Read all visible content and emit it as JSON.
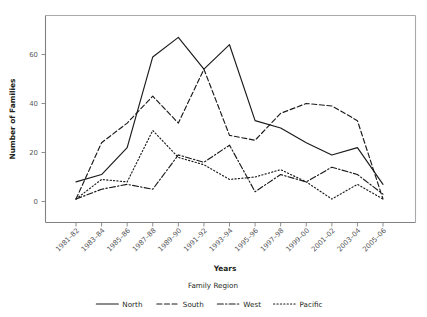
{
  "chart_data": {
    "type": "line",
    "title": "",
    "xlabel": "Years",
    "ylabel": "Number of Families",
    "legend_title": "Family Region",
    "legend_position": "bottom",
    "grid": false,
    "xlim": [
      0,
      12
    ],
    "ylim": [
      0,
      72
    ],
    "yticks": [
      0,
      20,
      40,
      60
    ],
    "ytick_labels": [
      "0",
      "20",
      "40",
      "60"
    ],
    "categories": [
      "1981–82",
      "1983–84",
      "1985–86",
      "1987–88",
      "1989–90",
      "1991–92",
      "1993–94",
      "1995–96",
      "1997–98",
      "1999–00",
      "2001–02",
      "2003–04",
      "2005–06"
    ],
    "series": [
      {
        "name": "North",
        "style": "solid",
        "values": [
          8,
          11,
          22,
          59,
          67,
          54,
          64,
          33,
          30,
          24,
          19,
          22,
          7
        ]
      },
      {
        "name": "South",
        "style": "dashed",
        "values": [
          1,
          24,
          32,
          43,
          32,
          54,
          27,
          25,
          36,
          40,
          39,
          33,
          1
        ]
      },
      {
        "name": "West",
        "style": "dashdot",
        "values": [
          1,
          5,
          7,
          5,
          19,
          16,
          23,
          4,
          11,
          8,
          14,
          11,
          3
        ]
      },
      {
        "name": "Pacific",
        "style": "dotted",
        "values": [
          1,
          9,
          8,
          29,
          18,
          15,
          9,
          10,
          13,
          8,
          1,
          7,
          1
        ]
      }
    ]
  },
  "legend": {
    "title": "Family Region",
    "entries": [
      {
        "label": "North",
        "style": "solid"
      },
      {
        "label": "South",
        "style": "dashed"
      },
      {
        "label": "West",
        "style": "dashdot"
      },
      {
        "label": "Pacific",
        "style": "dotted"
      }
    ]
  },
  "axes": {
    "x_title": "Years",
    "y_title": "Number of Families"
  }
}
